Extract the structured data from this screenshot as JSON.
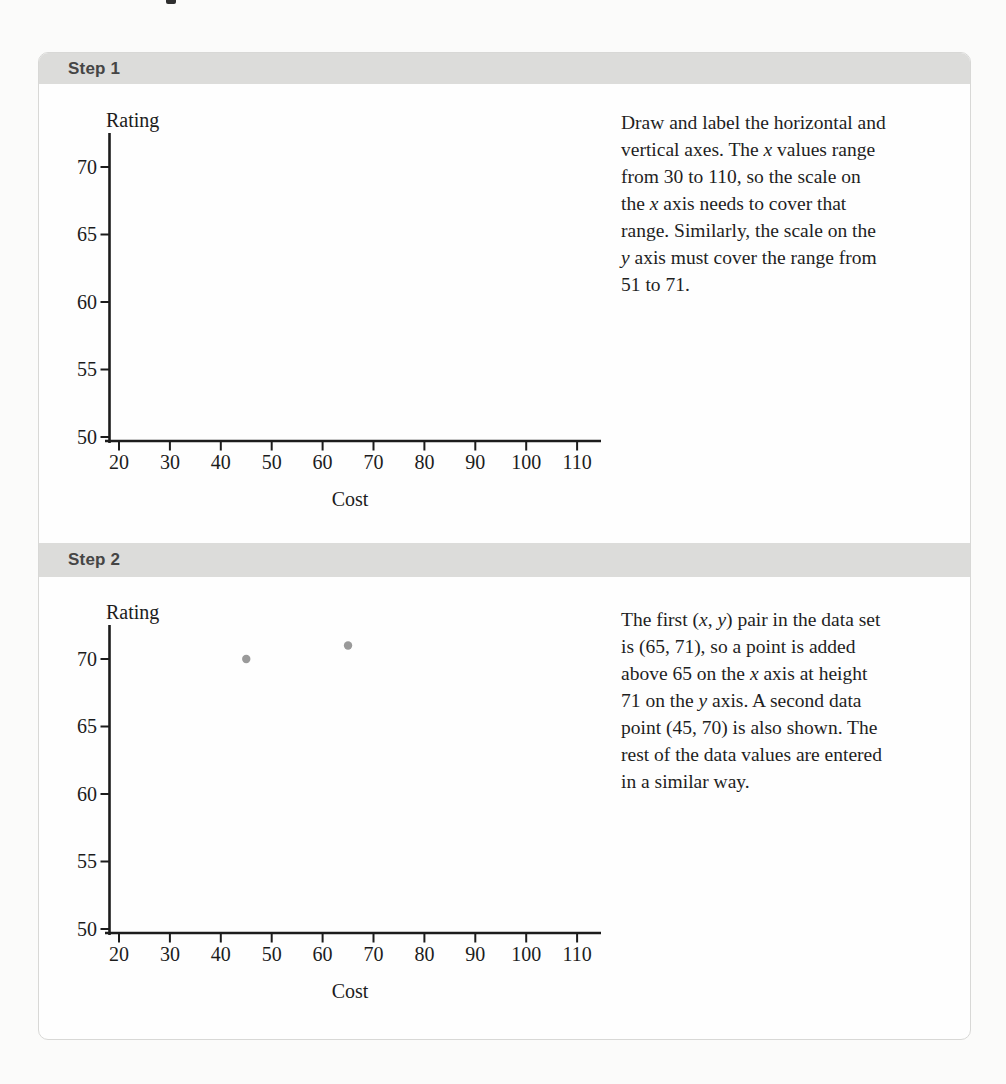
{
  "colors": {
    "page_background": "#fbfbfa",
    "panel_background": "#fefefe",
    "panel_border": "#d8d8d6",
    "header_bar": "#dcdcda",
    "header_text": "#454545",
    "body_text": "#1f1f1f",
    "axis": "#1c1c1c",
    "point": "#9a9a9a"
  },
  "steps": [
    {
      "header": "Step 1",
      "lines": [
        [
          {
            "t": "Draw and label the horizontal and"
          }
        ],
        [
          {
            "t": "vertical axes. The "
          },
          {
            "t": "x",
            "i": true
          },
          {
            "t": " values range"
          }
        ],
        [
          {
            "t": "from 30 to 110, so the scale on"
          }
        ],
        [
          {
            "t": "the "
          },
          {
            "t": "x",
            "i": true
          },
          {
            "t": " axis needs to cover that"
          }
        ],
        [
          {
            "t": "range. Similarly, the scale on the"
          }
        ],
        [
          {
            "t": "y",
            "i": true
          },
          {
            "t": " axis must cover the range from"
          }
        ],
        [
          {
            "t": "51 to 71."
          }
        ]
      ]
    },
    {
      "header": "Step 2",
      "lines": [
        [
          {
            "t": "The first ("
          },
          {
            "t": "x",
            "i": true
          },
          {
            "t": ", "
          },
          {
            "t": "y",
            "i": true
          },
          {
            "t": ") pair in the data set"
          }
        ],
        [
          {
            "t": "is (65, 71), so a point is added"
          }
        ],
        [
          {
            "t": "above 65 on the "
          },
          {
            "t": "x",
            "i": true
          },
          {
            "t": " axis at height"
          }
        ],
        [
          {
            "t": "71 on the "
          },
          {
            "t": "y",
            "i": true
          },
          {
            "t": " axis. A second data"
          }
        ],
        [
          {
            "t": "point (45, 70) is also shown. The"
          }
        ],
        [
          {
            "t": "rest of the data values are entered"
          }
        ],
        [
          {
            "t": "in a similar way."
          }
        ]
      ]
    }
  ],
  "chart_data": [
    {
      "type": "scatter",
      "title": "",
      "xlabel": "Cost",
      "ylabel": "Rating",
      "x_ticks": [
        20,
        30,
        40,
        50,
        60,
        70,
        80,
        90,
        100,
        110
      ],
      "y_ticks": [
        50,
        55,
        60,
        65,
        70
      ],
      "xlim": [
        15,
        114
      ],
      "ylim": [
        49.5,
        72.5
      ],
      "grid": false,
      "legend": false,
      "points": []
    },
    {
      "type": "scatter",
      "title": "",
      "xlabel": "Cost",
      "ylabel": "Rating",
      "x_ticks": [
        20,
        30,
        40,
        50,
        60,
        70,
        80,
        90,
        100,
        110
      ],
      "y_ticks": [
        50,
        55,
        60,
        65,
        70
      ],
      "xlim": [
        15,
        114
      ],
      "ylim": [
        49.5,
        72.5
      ],
      "grid": false,
      "legend": false,
      "points": [
        {
          "x": 45,
          "y": 70
        },
        {
          "x": 65,
          "y": 71
        }
      ]
    }
  ]
}
